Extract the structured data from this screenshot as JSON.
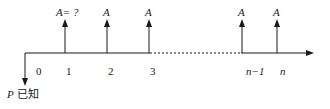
{
  "diagram": {
    "type": "cash-flow-diagram",
    "present_value_label": "P 已知",
    "present_value_symbol": "P",
    "present_value_note": "已知",
    "periods": [
      {
        "tick": "0",
        "arrow_label": null
      },
      {
        "tick": "1",
        "arrow_label": "A= ?"
      },
      {
        "tick": "2",
        "arrow_label": "A"
      },
      {
        "tick": "3",
        "arrow_label": "A"
      },
      {
        "tick": "n−1",
        "arrow_label": "A"
      },
      {
        "tick": "n",
        "arrow_label": "A"
      }
    ],
    "colors": {
      "line": "#1a1a1a",
      "background": "#ffffff"
    }
  }
}
